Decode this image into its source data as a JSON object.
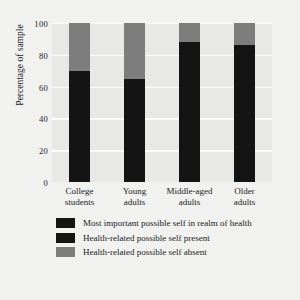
{
  "chart_data": {
    "type": "bar",
    "subtype": "stacked-bar",
    "title": "",
    "xlabel": "",
    "ylabel": "Percentage of sample",
    "ylim": [
      0,
      100
    ],
    "yticks": [
      100,
      80,
      60,
      40,
      20,
      0
    ],
    "grid": true,
    "legend_position": "bottom",
    "categories": [
      "College students",
      "Young adults",
      "Middle-aged adults",
      "Older adults"
    ],
    "category_lines": [
      {
        "line1": "College",
        "line2": "students"
      },
      {
        "line1": "Young",
        "line2": "adults"
      },
      {
        "line1": "Middle-aged",
        "line2": "adults"
      },
      {
        "line1": "Older",
        "line2": "adults"
      }
    ],
    "series": [
      {
        "name": "Health-related possible self present",
        "color": "#141414",
        "values": [
          70,
          65,
          88,
          86
        ]
      },
      {
        "name": "Health-related possible self absent",
        "color": "#7d7d7d",
        "values": [
          30,
          35,
          12,
          14
        ]
      }
    ],
    "legend": [
      {
        "label": "Most important possible self in realm of health",
        "color": "#141414"
      },
      {
        "label": "Health-related possible self present",
        "color": "#141414"
      },
      {
        "label": "Health-related possible self absent",
        "color": "#7d7d7d"
      }
    ]
  },
  "colors": {
    "figure_background": "#f1f1f0",
    "plot_background": "#e8e8e7",
    "gridline": "#fbfbfb",
    "dark_segment": "#141414",
    "gray_segment": "#7d7d7d",
    "text": "#1a1a1a"
  }
}
